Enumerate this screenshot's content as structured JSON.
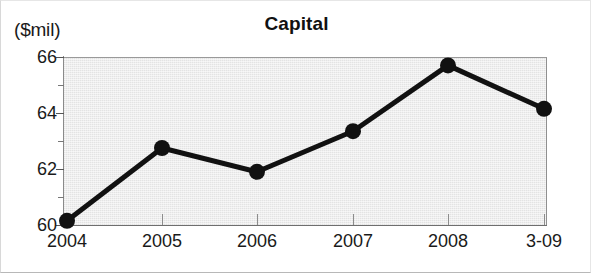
{
  "chart_data": {
    "type": "line",
    "title": "Capital",
    "ylabel": "($mil)",
    "xlabel": "",
    "categories": [
      "2004",
      "2005",
      "2006",
      "2007",
      "2008",
      "3-09"
    ],
    "values": [
      60.15,
      62.75,
      61.9,
      63.35,
      65.7,
      64.15
    ],
    "series": [
      {
        "name": "Capital",
        "values": [
          60.15,
          62.75,
          61.9,
          63.35,
          65.7,
          64.15
        ]
      }
    ],
    "ylim": [
      60,
      66
    ],
    "y_major_ticks": [
      "60",
      "62",
      "64",
      "66"
    ],
    "y_minor_ticks": [
      61,
      63,
      65
    ],
    "grid": false,
    "legend": "none",
    "marker": "filled-circle",
    "line_color": "#111111",
    "marker_color": "#111111",
    "plot_background": "#e3e3e3"
  }
}
